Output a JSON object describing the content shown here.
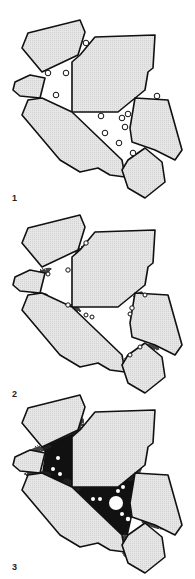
{
  "figure": {
    "colors": {
      "grain_fill": "#e2e2e2",
      "grain_stroke": "#111111",
      "cement": "#111111",
      "pore": "#ffffff",
      "background": "#ffffff"
    },
    "panels": [
      {
        "label": "1",
        "stage": "loose grains with bubbles in pore space",
        "offset_y": 0
      },
      {
        "label": "2",
        "stage": "initial cement at grain contacts",
        "offset_y": 195
      },
      {
        "label": "3",
        "stage": "extensive cement filling pore throats",
        "offset_y": 370
      }
    ],
    "grains": [
      {
        "name": "grain-top-left",
        "points": "28,33 80,20 85,32 78,55 42,72 22,48"
      },
      {
        "name": "grain-large-top",
        "points": "95,37 155,35 153,68 148,72 145,90 118,112 72,112 72,62 80,55"
      },
      {
        "name": "grain-small-left",
        "points": "15,82 30,75 45,78 40,98 20,96 13,90"
      },
      {
        "name": "grain-long-diagonal",
        "points": "28,100 42,98 72,112 122,160 125,177 110,175 98,168 80,172 60,160 22,115"
      },
      {
        "name": "grain-right",
        "points": "135,98 168,100 182,150 175,160 155,150 132,142 130,128"
      },
      {
        "name": "grain-bottom-right",
        "points": "145,148 162,162 165,182 145,198 128,188 122,170 128,160"
      }
    ],
    "panel1_bubbles": [
      [
        86,
        43
      ],
      [
        48,
        73
      ],
      [
        66,
        73
      ],
      [
        56,
        95
      ],
      [
        157,
        96
      ],
      [
        101,
        116
      ],
      [
        128,
        114
      ],
      [
        122,
        118
      ],
      [
        125,
        127
      ],
      [
        105,
        133
      ],
      [
        119,
        143
      ],
      [
        133,
        153
      ]
    ]
  }
}
